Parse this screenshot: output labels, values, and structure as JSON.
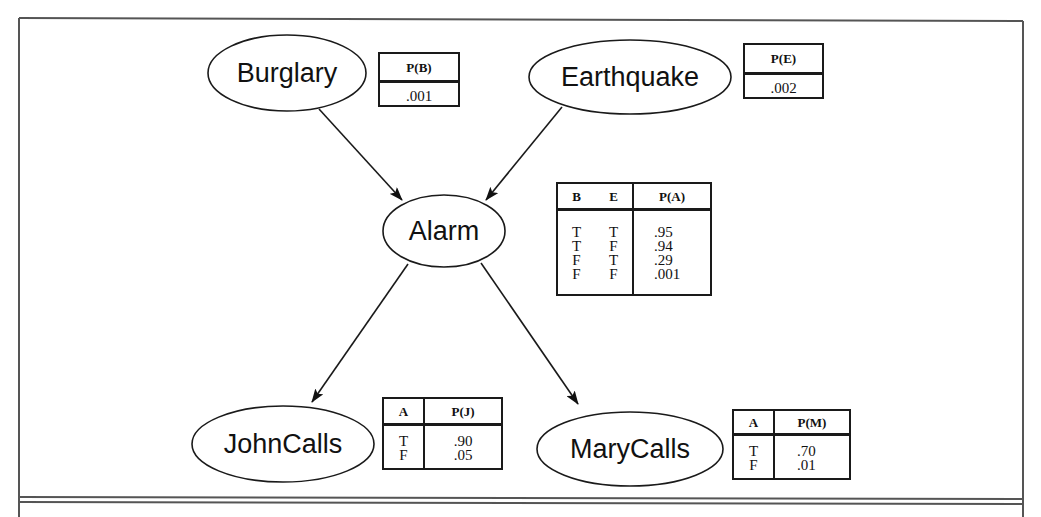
{
  "diagram": {
    "type": "bayesian-network",
    "nodes": [
      {
        "id": "burglary",
        "label": "Burglary",
        "cx": 287,
        "cy": 73,
        "rx": 79,
        "ry": 38
      },
      {
        "id": "earthquake",
        "label": "Earthquake",
        "cx": 630,
        "cy": 77,
        "rx": 101,
        "ry": 37
      },
      {
        "id": "alarm",
        "label": "Alarm",
        "cx": 444,
        "cy": 231,
        "rx": 61,
        "ry": 36
      },
      {
        "id": "johncalls",
        "label": "JohnCalls",
        "cx": 283,
        "cy": 444,
        "rx": 91,
        "ry": 38
      },
      {
        "id": "marycalls",
        "label": "MaryCalls",
        "cx": 630,
        "cy": 449,
        "rx": 93,
        "ry": 37
      }
    ],
    "edges": [
      {
        "from": "Burglary",
        "to": "Alarm"
      },
      {
        "from": "Earthquake",
        "to": "Alarm"
      },
      {
        "from": "Alarm",
        "to": "JohnCalls"
      },
      {
        "from": "Alarm",
        "to": "MaryCalls"
      }
    ],
    "cpts": {
      "burglary": {
        "header": "P(B)",
        "values": [
          ".001"
        ]
      },
      "earthquake": {
        "header": "P(E)",
        "values": [
          ".002"
        ]
      },
      "alarm": {
        "cond_headers": [
          "B",
          "E"
        ],
        "header": "P(A)",
        "rows": [
          {
            "b": "T",
            "e": "T",
            "p": ".95"
          },
          {
            "b": "T",
            "e": "F",
            "p": ".94"
          },
          {
            "b": "F",
            "e": "T",
            "p": ".29"
          },
          {
            "b": "F",
            "e": "F",
            "p": ".001"
          }
        ]
      },
      "johncalls": {
        "cond_headers": [
          "A"
        ],
        "header": "P(J)",
        "rows": [
          {
            "a": "T",
            "p": ".90"
          },
          {
            "a": "F",
            "p": ".05"
          }
        ]
      },
      "marycalls": {
        "cond_headers": [
          "A"
        ],
        "header": "P(M)",
        "rows": [
          {
            "a": "T",
            "p": ".70"
          },
          {
            "a": "F",
            "p": ".01"
          }
        ]
      }
    }
  },
  "colors": {
    "stroke": "#1a1a1a",
    "frame": "#555555",
    "background": "#ffffff"
  }
}
